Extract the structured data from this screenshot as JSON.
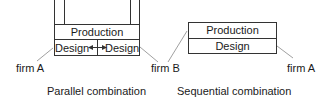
{
  "diagram": {
    "parallel": {
      "top_row": "Production",
      "bottom_left": "Design",
      "bottom_right": "Design",
      "arrow": "bidirectional-arrow",
      "left_firm": "firm A",
      "right_firm": "firm B",
      "caption": "Parallel combination"
    },
    "sequential": {
      "top_row": "Production",
      "bottom_row": "Design",
      "left_firm": "firm B",
      "right_firm": "firm A",
      "caption": "Sequential combination"
    },
    "colors": {
      "line": "#333333",
      "leader": "#888888",
      "text": "#1a1a1a"
    }
  }
}
